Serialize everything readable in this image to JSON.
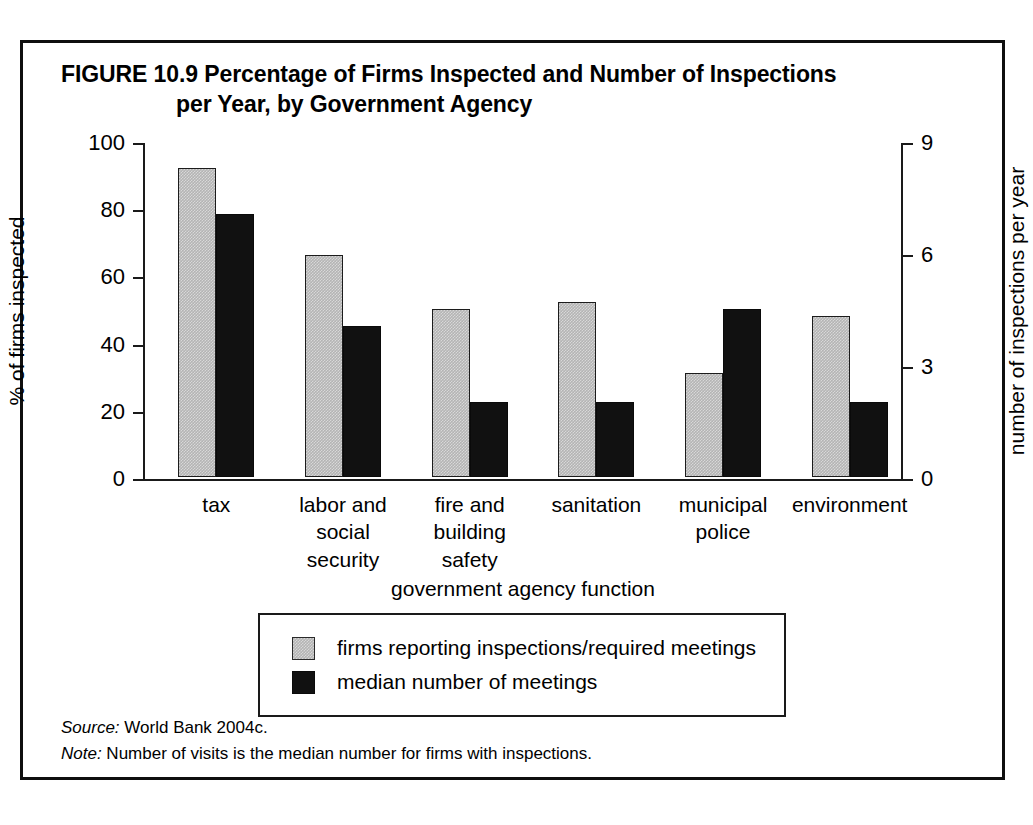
{
  "figure": {
    "label": "FIGURE 10.9",
    "title_line1": "Percentage of Firms Inspected and Number of Inspections",
    "title_line2": "per Year, by Government Agency"
  },
  "footer": {
    "source_lead": "Source:",
    "source_text": " World Bank 2004c.",
    "note_lead": "Note:",
    "note_text": " Number of visits is the median number for firms with inspections."
  },
  "colors": {
    "series_a": "#b4b4b4",
    "series_b": "#111111",
    "frame": "#0f0f0f",
    "axis": "#1a1a1a"
  },
  "chart_data": {
    "type": "bar",
    "title": "FIGURE 10.9 Percentage of Firms Inspected and Number of Inspections per Year, by Government Agency",
    "xlabel": "government agency function",
    "ylabel": "% of firms inspected",
    "y2label": "number of inspections per year",
    "ylim": [
      0,
      100
    ],
    "y2lim": [
      0,
      9
    ],
    "yticks": [
      0,
      20,
      40,
      60,
      80,
      100
    ],
    "y2ticks": [
      0,
      3,
      6,
      9
    ],
    "ytick_labels": [
      "0",
      "20",
      "40",
      "60",
      "80",
      "100"
    ],
    "y2tick_labels": [
      "0",
      "3",
      "6",
      "9"
    ],
    "grid": false,
    "legend_position": "below-plot",
    "categories": [
      "tax",
      "labor and social security",
      "fire and building safety",
      "sanitation",
      "municipal police",
      "environment"
    ],
    "category_lines": [
      [
        "tax"
      ],
      [
        "labor and",
        "social",
        "security"
      ],
      [
        "fire and",
        "building",
        "safety"
      ],
      [
        "sanitation"
      ],
      [
        "municipal",
        "police"
      ],
      [
        "environment"
      ]
    ],
    "series": [
      {
        "name": "firms reporting inspections/required meetings",
        "axis": "left",
        "unit": "percent",
        "color": "#b4b4b4",
        "values": [
          92,
          66,
          50,
          52,
          31,
          48
        ]
      },
      {
        "name": "median number of meetings",
        "axis": "right",
        "unit": "inspections per year",
        "color": "#111111",
        "values": [
          7.05,
          4.05,
          2.0,
          2.0,
          4.5,
          2.0
        ]
      }
    ]
  }
}
